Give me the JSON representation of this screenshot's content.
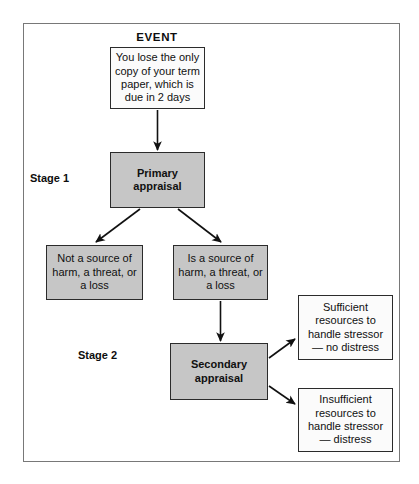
{
  "figure": {
    "title": "EVENT",
    "stage_labels": [
      {
        "id": "stage-1",
        "text": "Stage 1"
      },
      {
        "id": "stage-2",
        "text": "Stage 2"
      }
    ],
    "nodes": [
      {
        "id": "event-box",
        "name": "event-description-box",
        "text": "You lose the only copy of your term paper, which is due in 2 days",
        "style": "white"
      },
      {
        "id": "primary-appraisal",
        "name": "primary-appraisal-box",
        "text": "Primary appraisal",
        "style": "gray-bold"
      },
      {
        "id": "not-a-source",
        "name": "not-a-source-outcome-box",
        "text": "Not a source of harm, a threat, or a loss",
        "style": "gray"
      },
      {
        "id": "is-a-source",
        "name": "is-a-source-outcome-box",
        "text": "Is a source of harm, a threat, or a loss",
        "style": "gray"
      },
      {
        "id": "secondary-appraisal",
        "name": "secondary-appraisal-box",
        "text": "Secondary appraisal",
        "style": "gray-bold"
      },
      {
        "id": "sufficient-resources",
        "name": "sufficient-resources-outcome-box",
        "text": "Sufficient resources to handle stressor— no distress",
        "style": "white"
      },
      {
        "id": "insufficient-resources",
        "name": "insufficient-resources-outcome-box",
        "text": "Insufficient resources to handle stressor— distress",
        "style": "white"
      }
    ],
    "colors": {
      "box_fill_gray": "#c6c6c6",
      "box_fill_white": "#fbfbfb",
      "box_border": "#2b2b2b",
      "frame_border": "#787878",
      "arrow": "#111111",
      "text": "#101010"
    }
  }
}
